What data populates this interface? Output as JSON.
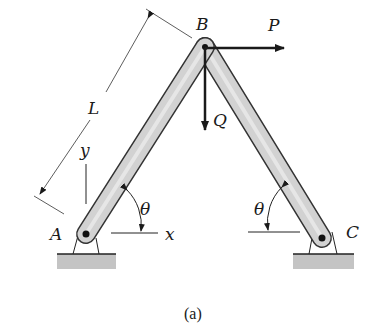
{
  "figure": {
    "caption": "(a)",
    "points": {
      "A": "A",
      "B": "B",
      "C": "C"
    },
    "forces": {
      "horizontal": "P",
      "vertical": "Q"
    },
    "dimension": "L",
    "axes": {
      "x": "x",
      "y": "y"
    },
    "angle_left": "θ",
    "angle_right": "θ"
  },
  "colors": {
    "bar_fill": "#cfcfcf",
    "bar_stroke": "#333333",
    "ground_fill": "#bdbdbd",
    "line": "#1a1a1a"
  }
}
